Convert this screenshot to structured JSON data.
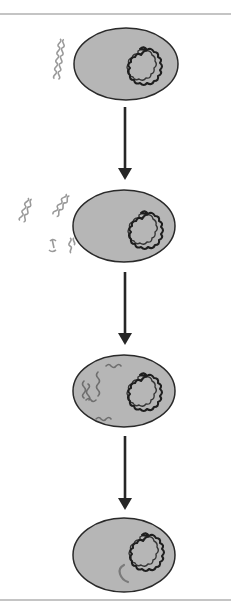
{
  "diagram": {
    "type": "process-flow",
    "orientation": "vertical",
    "colors": {
      "background": "#ffffff",
      "rule": "#8a8a8a",
      "cell_fill": "#b6b6b6",
      "cell_stroke": "#2a2a2a",
      "chromosome": "#1e1e1e",
      "foreign_dna_outside": "#9a9a9a",
      "foreign_dna_inside": "#6e6e6e",
      "integrated_segment": "#7a7a7a",
      "arrow": "#262626"
    },
    "stages": [
      {
        "id": 1,
        "label": "",
        "description": "Double-stranded DNA fragment adjacent to bacterial cell with circular chromosome"
      },
      {
        "id": 2,
        "label": "",
        "description": "Several DNA fragments near the cell surface, some binding"
      },
      {
        "id": 3,
        "label": "",
        "description": "Single-stranded DNA fragments inside the cytoplasm"
      },
      {
        "id": 4,
        "label": "",
        "description": "Foreign DNA segment integrated into the circular chromosome"
      }
    ],
    "arrows": [
      {
        "from": 1,
        "to": 2
      },
      {
        "from": 2,
        "to": 3
      },
      {
        "from": 3,
        "to": 4
      }
    ]
  }
}
